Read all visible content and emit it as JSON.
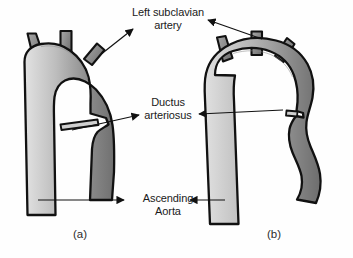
{
  "figure": {
    "background_color": "#fefefe",
    "vessel_outline_color": "#111111",
    "vessel_fill_light": "#d8d8d8",
    "vessel_fill_mid": "#9a9a9a",
    "vessel_fill_dark": "#6e6e6e",
    "arrow_color": "#111111",
    "text_color": "#1a1a1a"
  },
  "labels": {
    "subclavian": {
      "line1": "Left subclavian",
      "line2": "artery"
    },
    "ductus": {
      "line1": "Ductus",
      "line2": "arteriosus"
    },
    "ascending": {
      "line1": "Ascending",
      "line2": "Aorta"
    }
  },
  "captions": {
    "panel_a": "(a)",
    "panel_b": "(b)"
  },
  "panels": [
    {
      "id": "a",
      "caption": "(a)",
      "description": "Normal aortic arch with wide arch, three brachiocephalic branch vessels and patent ductus arteriosus stub",
      "branch_count": 3
    },
    {
      "id": "b",
      "caption": "(b)",
      "description": "Aortic arch with coarctation, narrowed isthmus and irregular descending aorta",
      "branch_count": 3
    }
  ],
  "annotations": [
    {
      "name": "subclavian-arrow-a",
      "label": "Left subclavian artery",
      "points_to": "panel a left subclavian branch",
      "direction": "up-right"
    },
    {
      "name": "subclavian-arrow-b",
      "label": "Left subclavian artery",
      "points_to": "panel b left subclavian branch",
      "direction": "left"
    },
    {
      "name": "ductus-arrow-a",
      "label": "Ductus arteriosus",
      "points_to": "panel a ductus stub",
      "direction": "right"
    },
    {
      "name": "ductus-arrow-b",
      "label": "Ductus arteriosus",
      "points_to": "panel b ductus stub",
      "direction": "left"
    },
    {
      "name": "ascending-arrow-a",
      "label": "Ascending Aorta",
      "points_to": "panel a ascending aorta",
      "direction": "right"
    },
    {
      "name": "ascending-arrow-b",
      "label": "Ascending Aorta",
      "points_to": "panel b ascending aorta",
      "direction": "left"
    }
  ]
}
